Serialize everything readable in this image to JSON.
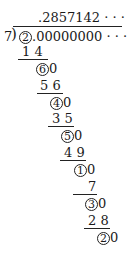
{
  "division": {
    "divisor": "7",
    "dividend_circled": "2",
    "dividend_rest": ".00000000 · · ·",
    "quotient": ".2857142 · · ·",
    "steps": [
      {
        "subtract": "1 4",
        "remainder": "6",
        "trail": "0"
      },
      {
        "subtract": "5 6",
        "remainder": "4",
        "trail": "0"
      },
      {
        "subtract": "3 5",
        "remainder": "5",
        "trail": "0"
      },
      {
        "subtract": "4 9",
        "remainder": "1",
        "trail": "0"
      },
      {
        "subtract": "7",
        "remainder": "3",
        "trail": "0"
      },
      {
        "subtract": "2 8",
        "remainder": "2",
        "trail": "0"
      }
    ]
  }
}
